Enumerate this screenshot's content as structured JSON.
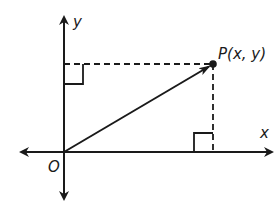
{
  "diagram": {
    "type": "coordinate-plane-position-vector",
    "labels": {
      "y_axis": "y",
      "x_axis": "x",
      "origin": "O",
      "point": "P(x, y)"
    },
    "colors": {
      "stroke": "#1a1a1a",
      "background": "#ffffff"
    },
    "elements": {
      "axes": [
        "x-axis (bidirectional arrow)",
        "y-axis (bidirectional arrow)"
      ],
      "vector": "arrow from O to P",
      "projections": [
        "dashed horizontal from P to y-axis",
        "dashed vertical from P to x-axis"
      ],
      "right_angle_markers": 2
    }
  }
}
